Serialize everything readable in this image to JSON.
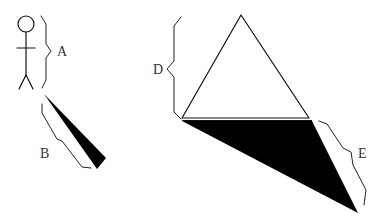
{
  "diagram": {
    "labels": {
      "A": "A",
      "B": "B",
      "D": "D",
      "E": "E"
    },
    "colors": {
      "stroke": "#111111",
      "shadow_fill": "#000000",
      "label": "#333333",
      "background": "#ffffff"
    },
    "elements": [
      {
        "id": "stick-figure",
        "label_ref": "A",
        "meaning": "height of person"
      },
      {
        "id": "person-shadow",
        "label_ref": "B",
        "meaning": "length of person's shadow"
      },
      {
        "id": "triangle",
        "label_ref": "D",
        "meaning": "height of triangle/pyramid"
      },
      {
        "id": "triangle-shadow",
        "label_ref": "E",
        "meaning": "length of triangle's shadow"
      }
    ]
  }
}
